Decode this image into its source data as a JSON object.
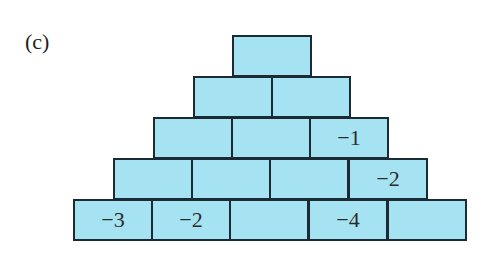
{
  "label": "(c)",
  "colors": {
    "brick_fill": "#a6e3f2",
    "brick_border": "#1b2a33"
  },
  "pyramid": {
    "rows": [
      {
        "cells": [
          ""
        ]
      },
      {
        "cells": [
          "",
          ""
        ]
      },
      {
        "cells": [
          "",
          "",
          "−1"
        ]
      },
      {
        "cells": [
          "",
          "",
          "",
          "−2"
        ]
      },
      {
        "cells": [
          "−3",
          "−2",
          "",
          "−4",
          ""
        ]
      }
    ]
  }
}
